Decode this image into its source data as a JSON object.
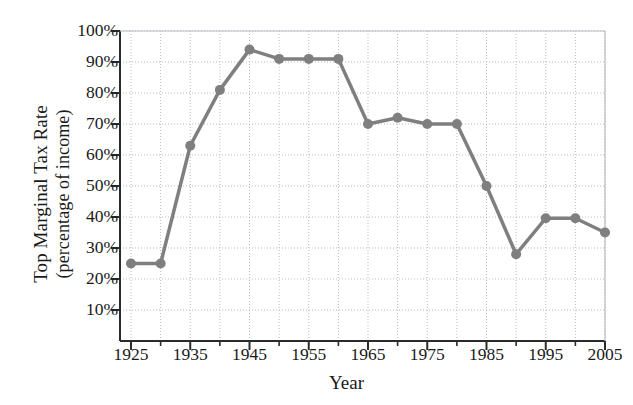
{
  "chart_data": {
    "type": "line",
    "title": "",
    "xlabel": "Year",
    "ylabel": "Top Marginal Tax Rate (percentage of income)",
    "ylabel_line1": "Top Marginal Tax Rate",
    "ylabel_line2": "(percentage of income)",
    "x": [
      1925,
      1930,
      1935,
      1940,
      1945,
      1950,
      1955,
      1960,
      1965,
      1970,
      1975,
      1980,
      1985,
      1990,
      1995,
      2000,
      2005
    ],
    "values": [
      25,
      25,
      63,
      81,
      94,
      91,
      91,
      91,
      70,
      72,
      70,
      70,
      50,
      28,
      39.6,
      39.6,
      35
    ],
    "xlim": [
      1922,
      2008
    ],
    "ylim": [
      0,
      103
    ],
    "x_ticks": [
      1925,
      1935,
      1945,
      1955,
      1965,
      1975,
      1985,
      1995,
      2005
    ],
    "x_tick_labels": [
      "1925",
      "1935",
      "1945",
      "1955",
      "1965",
      "1975",
      "1985",
      "1995",
      "2005"
    ],
    "x_minor_ticks": [
      1930,
      1940,
      1950,
      1960,
      1970,
      1980,
      1990,
      2000
    ],
    "y_ticks": [
      10,
      20,
      30,
      40,
      50,
      60,
      70,
      80,
      90,
      100
    ],
    "y_tick_labels": [
      "10%",
      "20%",
      "30%",
      "40%",
      "50%",
      "60%",
      "70%",
      "80%",
      "90%",
      "100%"
    ],
    "grid": true,
    "grid_style": "dotted",
    "legend": "none",
    "series_color": "#7f7f7f",
    "marker": "circle",
    "marker_size": 5,
    "line_width": 3.5,
    "axis_color": "#2b2b2b",
    "grid_color": "#b9b9c4",
    "background": "#ffffff"
  }
}
